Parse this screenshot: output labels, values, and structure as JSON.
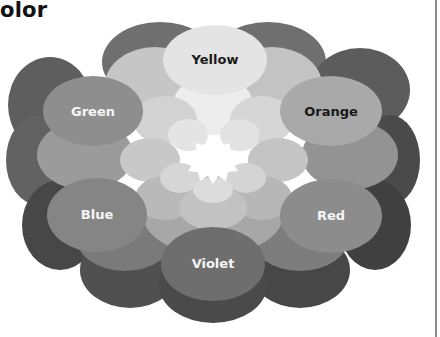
{
  "title": "olor",
  "wheel": {
    "segments": [
      {
        "name": "Yellow",
        "label_color": "#1a1a1a",
        "fill": "#e4e4e4",
        "cx": 215,
        "cy": 60,
        "rx": 52,
        "ry": 35
      },
      {
        "name": "Orange",
        "label_color": "#1a1a1a",
        "fill": "#a9a9a9",
        "cx": 331,
        "cy": 111,
        "rx": 51,
        "ry": 35
      },
      {
        "name": "Red",
        "label_color": "#f5f5f5",
        "fill": "#8c8c8c",
        "cx": 331,
        "cy": 216,
        "rx": 51,
        "ry": 37
      },
      {
        "name": "Violet",
        "label_color": "#f5f5f5",
        "fill": "#6e6e6e",
        "cx": 213,
        "cy": 264,
        "rx": 52,
        "ry": 37
      },
      {
        "name": "Blue",
        "label_color": "#f5f5f5",
        "fill": "#858585",
        "cx": 97,
        "cy": 215,
        "rx": 50,
        "ry": 37
      },
      {
        "name": "Green",
        "label_color": "#f5f5f5",
        "fill": "#8e8e8e",
        "cx": 93,
        "cy": 111,
        "rx": 50,
        "ry": 35
      }
    ]
  }
}
